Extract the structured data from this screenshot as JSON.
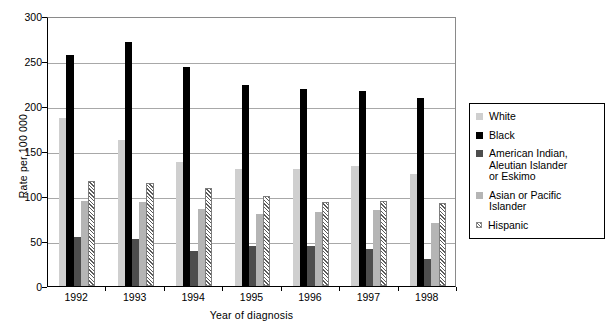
{
  "chart_data": {
    "type": "bar",
    "title": "",
    "xlabel": "Year of diagnosis",
    "ylabel": "Rate per 100 000",
    "ylim": [
      0,
      300
    ],
    "yticks": [
      0,
      50,
      100,
      150,
      200,
      250,
      300
    ],
    "ytick_labels": [
      "0",
      "50",
      "100",
      "150",
      "200",
      "250",
      "300"
    ],
    "grid": true,
    "legend_position": "right",
    "categories": [
      "1992",
      "1993",
      "1994",
      "1995",
      "1996",
      "1997",
      "1998"
    ],
    "series": [
      {
        "name": "White",
        "color": "#cfcfcf",
        "pattern": "solid",
        "values": [
          187,
          162,
          138,
          130,
          130,
          133,
          124
        ]
      },
      {
        "name": "Black",
        "color": "#000000",
        "pattern": "solid",
        "values": [
          257,
          271,
          243,
          223,
          219,
          217,
          209
        ]
      },
      {
        "name": "American Indian,\nAleutian Islander\nor Eskimo",
        "color": "#4d4d4d",
        "pattern": "solid",
        "values": [
          55,
          52,
          39,
          45,
          45,
          41,
          30
        ]
      },
      {
        "name": "Asian or Pacific Islander",
        "color": "#b5b5b5",
        "pattern": "solid",
        "values": [
          95,
          93,
          86,
          80,
          82,
          84,
          70
        ]
      },
      {
        "name": "Hispanic",
        "color": "#ffffff",
        "pattern": "diagonal-hatch",
        "values": [
          117,
          115,
          109,
          100,
          93,
          94,
          92
        ]
      }
    ]
  },
  "legend": {
    "items": [
      {
        "label": "White",
        "swatch": "white"
      },
      {
        "label": "Black",
        "swatch": "black"
      },
      {
        "label": "American Indian,\nAleutian Islander\nor Eskimo",
        "swatch": "amind"
      },
      {
        "label": "Asian or Pacific Islander",
        "swatch": "asian"
      },
      {
        "label": "Hispanic",
        "swatch": "hisp"
      }
    ]
  }
}
